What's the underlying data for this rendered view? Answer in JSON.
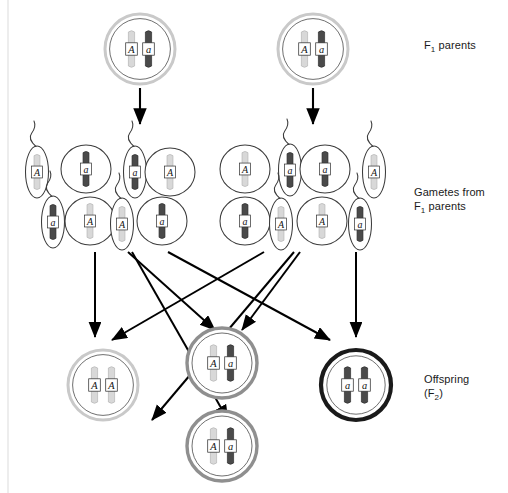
{
  "figure": {
    "background_color": "#ffffff"
  },
  "labels": {
    "parents": {
      "text_before": "F",
      "subscript": "1",
      "text_after": " parents"
    },
    "gametes_line1": "Gametes from",
    "gametes_before": "F",
    "gametes_subscript": "1",
    "gametes_after": " parents",
    "offspring_line1": "Offspring",
    "offspring_before": "(F",
    "offspring_subscript": "2",
    "offspring_after": ")"
  },
  "colors": {
    "allele_dominant": "#d8d8d8",
    "allele_recessive": "#4a4a4a",
    "allele_dominant_stroke": "#b4b4b4",
    "allele_recessive_stroke": "#2e2e2e",
    "cell_outline": "#3c3c3c",
    "membrane_light": "#c9c9c9",
    "membrane_medium": "#8f8f8f",
    "membrane_dark": "#1a1a1a",
    "arrow": "#000000",
    "label_text": "#1a1a1a"
  },
  "genotypes": {
    "dominant_symbol": "A",
    "recessive_symbol": "a"
  },
  "parents": [
    {
      "id": "parent-left",
      "cx": 140,
      "cy": 49,
      "genotype": [
        "A",
        "a"
      ],
      "membrane": "light"
    },
    {
      "id": "parent-right",
      "cx": 313,
      "cy": 49,
      "genotype": [
        "A",
        "a"
      ],
      "membrane": "light"
    }
  ],
  "parent_arrows": [
    {
      "id": "arrow-parent-left",
      "x1": 140,
      "y1": 88,
      "x2": 140,
      "y2": 124
    },
    {
      "id": "arrow-parent-right",
      "x1": 313,
      "y1": 88,
      "x2": 313,
      "y2": 124
    }
  ],
  "gametes": [
    {
      "id": "gamete-1",
      "type": "sperm",
      "cx": 37,
      "cy": 172,
      "allele": "A"
    },
    {
      "id": "gamete-2",
      "type": "egg",
      "cx": 86,
      "cy": 169,
      "allele": "a"
    },
    {
      "id": "gamete-3",
      "type": "sperm",
      "cx": 135,
      "cy": 172,
      "allele": "a"
    },
    {
      "id": "gamete-4",
      "type": "egg",
      "cx": 170,
      "cy": 172,
      "allele": "A"
    },
    {
      "id": "gamete-5",
      "type": "egg",
      "cx": 245,
      "cy": 169,
      "allele": "A"
    },
    {
      "id": "gamete-6",
      "type": "sperm",
      "cx": 290,
      "cy": 170,
      "allele": "a"
    },
    {
      "id": "gamete-7",
      "type": "egg",
      "cx": 325,
      "cy": 169,
      "allele": "a"
    },
    {
      "id": "gamete-8",
      "type": "sperm",
      "cx": 374,
      "cy": 172,
      "allele": "A"
    },
    {
      "id": "gamete-9",
      "type": "sperm",
      "cx": 53,
      "cy": 222,
      "allele": "a"
    },
    {
      "id": "gamete-10",
      "type": "egg",
      "cx": 90,
      "cy": 221,
      "allele": "A"
    },
    {
      "id": "gamete-11",
      "type": "sperm",
      "cx": 122,
      "cy": 224,
      "allele": "A"
    },
    {
      "id": "gamete-12",
      "type": "egg",
      "cx": 162,
      "cy": 221,
      "allele": "a"
    },
    {
      "id": "gamete-13",
      "type": "egg",
      "cx": 245,
      "cy": 221,
      "allele": "a"
    },
    {
      "id": "gamete-14",
      "type": "sperm",
      "cx": 281,
      "cy": 224,
      "allele": "A"
    },
    {
      "id": "gamete-15",
      "type": "egg",
      "cx": 322,
      "cy": 221,
      "allele": "A"
    },
    {
      "id": "gamete-16",
      "type": "sperm",
      "cx": 360,
      "cy": 224,
      "allele": "a"
    }
  ],
  "fertilization_arrows": [
    {
      "id": "fert-arrow-1",
      "x1": 95,
      "y1": 252,
      "x2": 95,
      "y2": 337
    },
    {
      "id": "fert-arrow-2",
      "x1": 128,
      "y1": 252,
      "x2": 215,
      "y2": 330
    },
    {
      "id": "fert-arrow-3",
      "x1": 132,
      "y1": 252,
      "x2": 228,
      "y2": 420
    },
    {
      "id": "fert-arrow-4",
      "x1": 168,
      "y1": 252,
      "x2": 330,
      "y2": 340
    },
    {
      "id": "fert-arrow-5",
      "x1": 264,
      "y1": 252,
      "x2": 112,
      "y2": 340
    },
    {
      "id": "fert-arrow-6",
      "x1": 294,
      "y1": 252,
      "x2": 152,
      "y2": 420
    },
    {
      "id": "fert-arrow-7",
      "x1": 300,
      "y1": 252,
      "x2": 242,
      "y2": 330
    },
    {
      "id": "fert-arrow-8",
      "x1": 356,
      "y1": 252,
      "x2": 356,
      "y2": 337
    }
  ],
  "offspring": [
    {
      "id": "offspring-AA",
      "cx": 103,
      "cy": 385,
      "genotype": [
        "A",
        "A"
      ],
      "membrane": "light"
    },
    {
      "id": "offspring-Aa1",
      "cx": 222,
      "cy": 363,
      "genotype": [
        "A",
        "a"
      ],
      "membrane": "medium"
    },
    {
      "id": "offspring-aa",
      "cx": 356,
      "cy": 385,
      "genotype": [
        "a",
        "a"
      ],
      "membrane": "dark"
    },
    {
      "id": "offspring-Aa2",
      "cx": 222,
      "cy": 446,
      "genotype": [
        "A",
        "a"
      ],
      "membrane": "medium"
    }
  ]
}
